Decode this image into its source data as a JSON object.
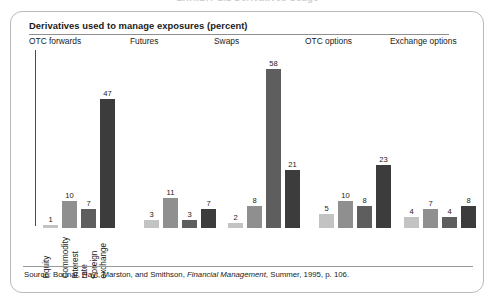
{
  "page": {
    "cut_off_header": "EXHIBIT 1.1   Derivatives Usage"
  },
  "panel": {
    "title": "Derivatives used to manage exposures (percent)",
    "source_prefix": "Source:",
    "source_authors": "Bodnar, Hayt, Marston, and Smithson,",
    "source_journal": "Financial Management",
    "source_rest": ", Summer, 1995, p. 106."
  },
  "chart_data": {
    "type": "bar",
    "title": "Derivatives used to manage exposures (percent)",
    "xlabel": "",
    "ylabel": "percent",
    "ylim": [
      0,
      58
    ],
    "grid": false,
    "legend_position": "none",
    "categories": [
      "OTC forwards",
      "Futures",
      "Swaps",
      "OTC options",
      "Exchange options"
    ],
    "series": [
      {
        "name": "Equity",
        "color": "#c3c3c3",
        "values": [
          1,
          3,
          2,
          5,
          4
        ]
      },
      {
        "name": "Commodity",
        "color": "#8f8f8f",
        "values": [
          10,
          11,
          8,
          10,
          7
        ]
      },
      {
        "name": "Interest rate",
        "color": "#5e5e5e",
        "values": [
          7,
          3,
          58,
          8,
          4
        ]
      },
      {
        "name": "Foreign exchange",
        "color": "#3c3c3c",
        "values": [
          47,
          7,
          21,
          23,
          8
        ]
      }
    ],
    "value_labels": [
      [
        1,
        10,
        7,
        47
      ],
      [
        3,
        11,
        3,
        7
      ],
      [
        2,
        8,
        58,
        21
      ],
      [
        5,
        10,
        8,
        23
      ],
      [
        4,
        7,
        4,
        8
      ]
    ],
    "category_axis_labels": [
      "Equity",
      "Commodity",
      "Interest rate",
      "Foreign exchange"
    ]
  }
}
